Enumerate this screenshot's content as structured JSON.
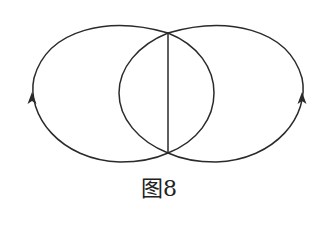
{
  "figure": {
    "caption": "图8",
    "stroke_color": "#2a2a2a",
    "background": "#ffffff"
  },
  "diagram": {
    "elements": [
      {
        "type": "outer-arc-left",
        "direction": "arrow pointing up on left side"
      },
      {
        "type": "outer-arc-right",
        "direction": "arrow pointing up on right side"
      },
      {
        "type": "inner-arc-left"
      },
      {
        "type": "inner-arc-right"
      },
      {
        "type": "vertical-chord"
      }
    ],
    "intersections": [
      [
        168,
        33
      ],
      [
        168,
        153
      ]
    ]
  }
}
